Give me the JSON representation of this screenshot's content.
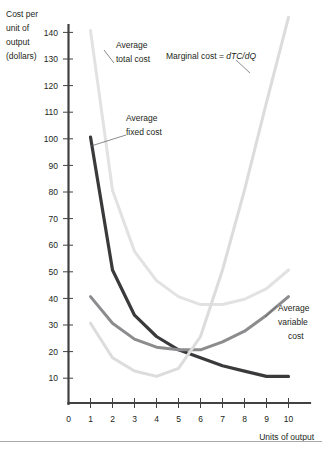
{
  "figure": {
    "background_color": "#ffffff",
    "axis_color": "#414042",
    "bottom_rule_color": "#a7a9ac"
  },
  "axes": {
    "y_title_lines": [
      "Cost per",
      "unit of",
      "output",
      "(dollars)"
    ],
    "x_title": "Units of output",
    "y_ticks": [
      "10",
      "20",
      "30",
      "40",
      "50",
      "60",
      "70",
      "80",
      "90",
      "100",
      "110",
      "120",
      "130",
      "140"
    ],
    "x_ticks": [
      "0",
      "1",
      "2",
      "3",
      "4",
      "5",
      "6",
      "7",
      "8",
      "9",
      "10"
    ],
    "y_min": 0,
    "y_max": 145,
    "x_min": 0,
    "x_max": 10.8
  },
  "labels": {
    "atc": {
      "line1": "Average",
      "line2": "total cost"
    },
    "afc": {
      "line1": "Average",
      "line2": "fixed cost"
    },
    "mc_prefix": "Marginal cost = ",
    "mc_formula": "dTC/dQ",
    "avc": {
      "line1": "Average",
      "line2": "variable",
      "line3": "cost"
    }
  },
  "chart_data": {
    "type": "line",
    "title": "",
    "xlabel": "Units of output",
    "ylabel": "Cost per unit of output (dollars)",
    "xlim": [
      0,
      10.8
    ],
    "ylim": [
      0,
      145
    ],
    "grid": false,
    "legend": "inline-annotations",
    "x": [
      1,
      2,
      3,
      4,
      5,
      6,
      7,
      8,
      9,
      10
    ],
    "series": [
      {
        "name": "Average fixed cost",
        "color": "#3a3a3c",
        "width": 3.2,
        "values": [
          100,
          50,
          33,
          25,
          20,
          17,
          14,
          12,
          10,
          10
        ]
      },
      {
        "name": "Average variable cost",
        "color": "#8c8c8e",
        "width": 3.0,
        "values": [
          40,
          30,
          24,
          21,
          20,
          20,
          23,
          27,
          33,
          40
        ]
      },
      {
        "name": "Average total cost",
        "color": "#e2e2e2",
        "width": 3.0,
        "values": [
          140,
          80,
          57,
          46,
          40,
          37,
          37,
          39,
          43,
          50
        ]
      },
      {
        "name": "Marginal cost = dTC/dQ",
        "color": "#dcdcdc",
        "width": 3.0,
        "values": [
          30,
          17,
          12,
          10,
          13,
          25,
          50,
          80,
          113,
          145
        ]
      }
    ]
  }
}
